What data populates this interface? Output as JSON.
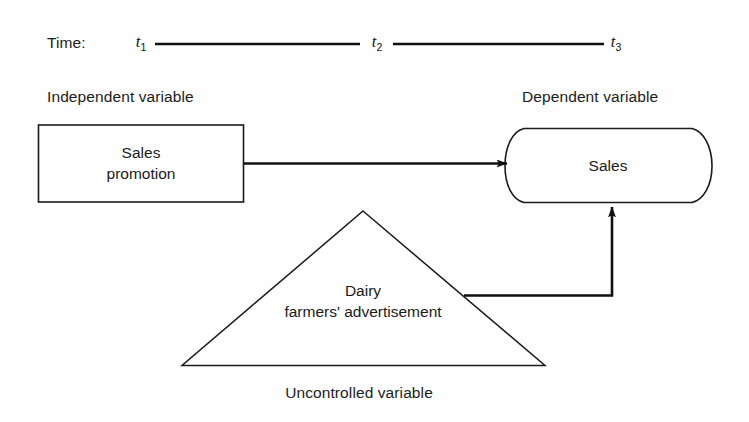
{
  "diagram": {
    "colors": {
      "background": "#fefefe",
      "stroke": "#1a1a1a",
      "arrow": "#111111",
      "text": "#1c1c1c"
    },
    "timeline": {
      "label": "Time:",
      "points": [
        {
          "id": "t1",
          "base": "t",
          "sub": "1"
        },
        {
          "id": "t2",
          "base": "t",
          "sub": "2"
        },
        {
          "id": "t3",
          "base": "t",
          "sub": "3"
        }
      ]
    },
    "captions": {
      "independent": "Independent variable",
      "dependent": "Dependent variable",
      "uncontrolled": "Uncontrolled variable"
    },
    "nodes": {
      "independent_node": {
        "shape": "rectangle",
        "line1": "Sales",
        "line2": "promotion"
      },
      "dependent_node": {
        "shape": "stadium",
        "line1": "Sales"
      },
      "uncontrolled_node": {
        "shape": "triangle",
        "line1": "Dairy",
        "line2": "farmers' advertisement"
      }
    },
    "arrows": [
      {
        "id": "promotion-to-sales",
        "from": "independent_node",
        "to": "dependent_node",
        "style": "straight-horizontal"
      },
      {
        "id": "advertisement-to-sales",
        "from": "uncontrolled_node",
        "to": "dependent_node",
        "style": "elbow-up"
      }
    ]
  }
}
